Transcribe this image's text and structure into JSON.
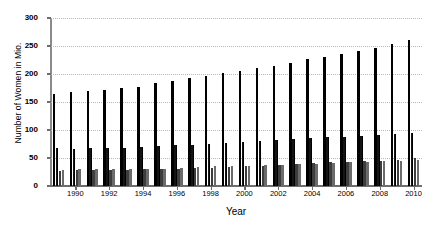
{
  "chart_data": {
    "type": "bar",
    "title": "",
    "subtitle": "",
    "xlabel": "Year",
    "ylabel": "Number of Women in Mio.",
    "ylim": [
      0,
      300
    ],
    "yticks": [
      0,
      50,
      100,
      150,
      200,
      250,
      300
    ],
    "ytick_labels": [
      "0",
      "50",
      "100",
      "150",
      "200",
      "250",
      "300"
    ],
    "grid": true,
    "grid_axis": "y",
    "grid_style": "dotted",
    "grid_color": "#b9b9b9",
    "legend": false,
    "legend_position": "none",
    "bar_colors": [
      "#000000",
      "#141414",
      "#3d3d3d",
      "#6b6b6b"
    ],
    "categories": [
      "1989",
      "1990",
      "1991",
      "1992",
      "1993",
      "1994",
      "1995",
      "1996",
      "1997",
      "1998",
      "1999",
      "2000",
      "2001",
      "2002",
      "2003",
      "2004",
      "2005",
      "2006",
      "2007",
      "2008",
      "2009",
      "2010"
    ],
    "xtick_labels": [
      "1990",
      "1992",
      "1994",
      "1996",
      "1998",
      "2000",
      "2002",
      "2004",
      "2006",
      "2008",
      "2010"
    ],
    "xtick_categories": [
      "1990",
      "1992",
      "1994",
      "1996",
      "1998",
      "2000",
      "2002",
      "2004",
      "2006",
      "2008",
      "2010"
    ],
    "series": [
      {
        "name": "series-1",
        "color": "#000000",
        "values": [
          165,
          167,
          170,
          172,
          175,
          176,
          184,
          188,
          192,
          197,
          201,
          206,
          210,
          214,
          220,
          226,
          231,
          236,
          241,
          246,
          253,
          260
        ]
      },
      {
        "name": "series-2",
        "color": "#141414",
        "values": [
          67,
          66,
          68,
          67,
          68,
          69,
          72,
          73,
          74,
          75,
          76,
          78,
          80,
          82,
          84,
          85,
          87,
          88,
          90,
          91,
          93,
          95
        ]
      },
      {
        "name": "series-3",
        "color": "#3d3d3d",
        "values": [
          27,
          28,
          28,
          29,
          29,
          30,
          30,
          31,
          32,
          33,
          34,
          35,
          36,
          38,
          39,
          41,
          42,
          43,
          44,
          45,
          47,
          50
        ]
      },
      {
        "name": "series-4",
        "color": "#6b6b6b",
        "values": [
          29,
          30,
          30,
          31,
          31,
          31,
          31,
          32,
          34,
          35,
          36,
          36,
          37,
          38,
          39,
          40,
          41,
          42,
          43,
          44,
          45,
          47
        ]
      }
    ]
  }
}
